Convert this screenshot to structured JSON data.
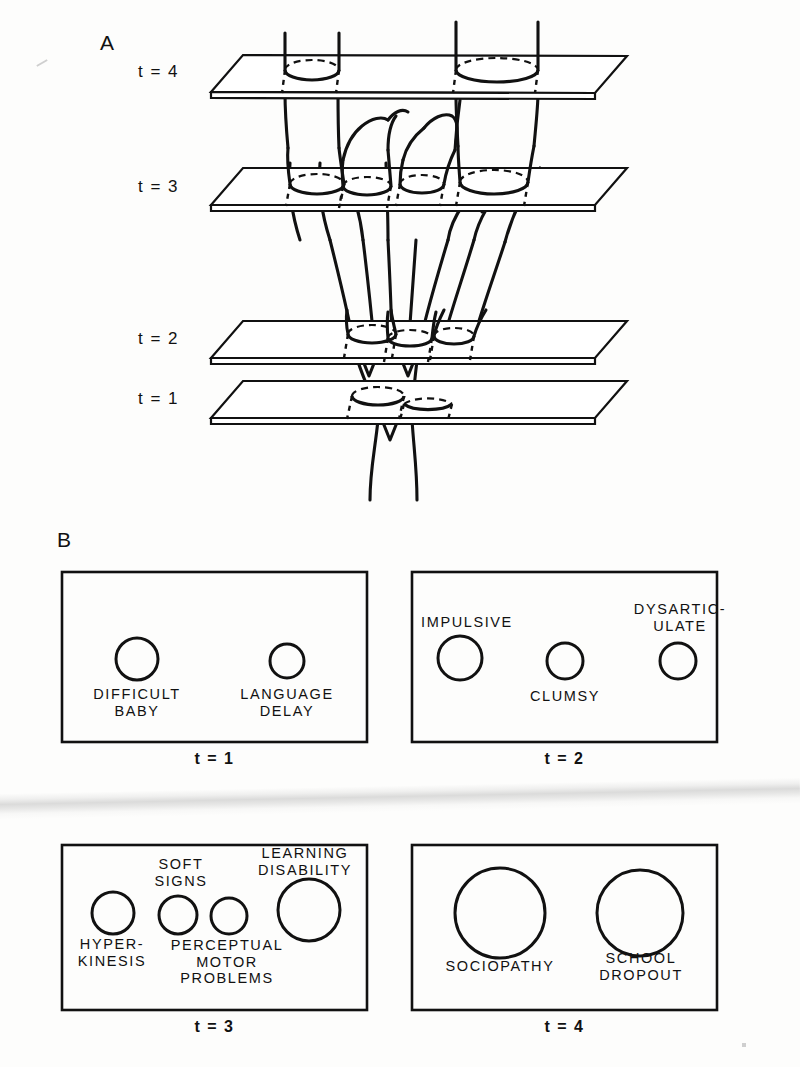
{
  "figure": {
    "panel_a": {
      "letter": "A",
      "time_labels": [
        {
          "text": "t = 4",
          "y": 62
        },
        {
          "text": "t = 3",
          "y": 177
        },
        {
          "text": "t = 2",
          "y": 329
        },
        {
          "text": "t = 1",
          "y": 389
        }
      ],
      "planes": [
        {
          "name": "plane-t4",
          "label": "t = 4",
          "cross_sections": 2
        },
        {
          "name": "plane-t3",
          "label": "t = 3",
          "cross_sections": 4
        },
        {
          "name": "plane-t2",
          "label": "t = 2",
          "cross_sections": 3
        },
        {
          "name": "plane-t1",
          "label": "t = 1",
          "cross_sections": 2
        }
      ]
    },
    "panel_b": {
      "letter": "B",
      "boxes": [
        {
          "id": "box-t1",
          "caption": "t = 1",
          "nodes": [
            {
              "label": "DIFFICULT\nBABY",
              "label_pos": "below"
            },
            {
              "label": "LANGUAGE\nDELAY",
              "label_pos": "below"
            }
          ]
        },
        {
          "id": "box-t2",
          "caption": "t = 2",
          "nodes": [
            {
              "label": "IMPULSIVE",
              "label_pos": "above"
            },
            {
              "label": "CLUMSY",
              "label_pos": "below"
            },
            {
              "label": "DYSARTIC-\nULATE",
              "label_pos": "above"
            }
          ]
        },
        {
          "id": "box-t3",
          "caption": "t = 3",
          "nodes": [
            {
              "label": "HYPER-\nKINESIS",
              "label_pos": "below"
            },
            {
              "label": "SOFT\nSIGNS",
              "label_pos": "above"
            },
            {
              "label": "PERCEPTUAL\nMOTOR\nPROBLEMS",
              "label_pos": "below"
            },
            {
              "label": "LEARNING\nDISABILITY",
              "label_pos": "above"
            }
          ]
        },
        {
          "id": "box-t4",
          "caption": "t = 4",
          "nodes": [
            {
              "label": "SOCIOPATHY",
              "label_pos": "below"
            },
            {
              "label": "SCHOOL\nDROPOUT",
              "label_pos": "below"
            }
          ]
        }
      ]
    },
    "colors": {
      "ink": "#111111",
      "paper": "#fdfdfc"
    }
  }
}
